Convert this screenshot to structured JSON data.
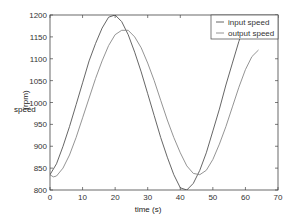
{
  "chart_data": {
    "type": "line",
    "title": "",
    "xlabel": "time (s)",
    "ylabel": "speed",
    "ylabel_unit": "(rpm)",
    "xlim": [
      0,
      70
    ],
    "ylim": [
      800,
      1200
    ],
    "xticks": [
      0,
      10,
      20,
      30,
      40,
      50,
      60,
      70
    ],
    "yticks": [
      800,
      850,
      900,
      950,
      1000,
      1050,
      1100,
      1150,
      1200
    ],
    "grid": false,
    "legend_position": "upper right",
    "series": [
      {
        "name": "input speed",
        "color": "#555555",
        "x": [
          0,
          2,
          4,
          6,
          8,
          10,
          12,
          14,
          16,
          18,
          20,
          22,
          24,
          26,
          28,
          30,
          32,
          34,
          36,
          38,
          40,
          42,
          44,
          46,
          48,
          50,
          52,
          54,
          56,
          58,
          60,
          62
        ],
        "y": [
          835,
          860,
          900,
          945,
          995,
          1045,
          1095,
          1135,
          1170,
          1195,
          1200,
          1185,
          1155,
          1115,
          1070,
          1020,
          970,
          920,
          875,
          835,
          805,
          800,
          815,
          845,
          885,
          935,
          985,
          1040,
          1090,
          1140,
          1180,
          1205
        ]
      },
      {
        "name": "output speed",
        "color": "#888888",
        "x": [
          0,
          1,
          2,
          4,
          6,
          8,
          10,
          12,
          14,
          16,
          18,
          20,
          22,
          24,
          26,
          28,
          30,
          32,
          34,
          36,
          38,
          40,
          42,
          44,
          46,
          48,
          50,
          52,
          54,
          56,
          58,
          60,
          62,
          64
        ],
        "y": [
          835,
          830,
          832,
          850,
          880,
          920,
          965,
          1010,
          1055,
          1095,
          1130,
          1155,
          1165,
          1165,
          1150,
          1125,
          1090,
          1050,
          1005,
          960,
          920,
          885,
          855,
          838,
          835,
          845,
          870,
          905,
          945,
          990,
          1035,
          1075,
          1105,
          1120
        ]
      }
    ]
  }
}
